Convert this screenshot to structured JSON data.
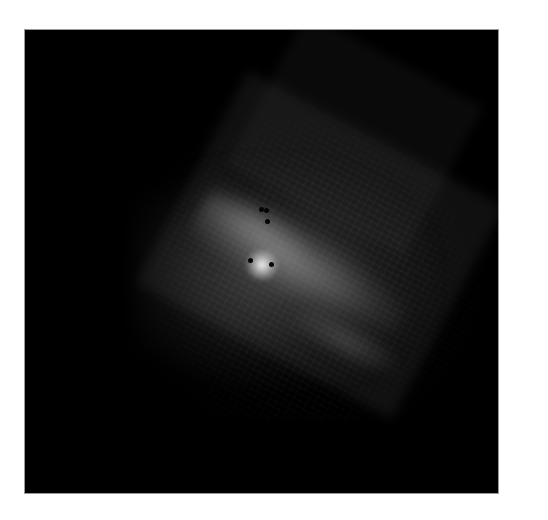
{
  "image": {
    "subject": "grayscale astronomical mosaic of a galaxy",
    "background_color": "#000000",
    "border_color": "#ffffff",
    "markers": [
      {
        "x": 236,
        "y": 180
      },
      {
        "x": 240,
        "y": 180
      },
      {
        "x": 241,
        "y": 191
      },
      {
        "x": 226,
        "y": 231
      },
      {
        "x": 246,
        "y": 235
      }
    ]
  }
}
